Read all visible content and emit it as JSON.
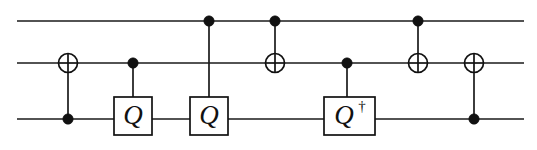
{
  "figure": {
    "type": "quantum-circuit",
    "width": 537,
    "height": 150,
    "background_color": "#ffffff",
    "ink_color": "#111111"
  },
  "wires": [
    {
      "id": "wire-top",
      "index": 0,
      "label": "",
      "y": 21,
      "x_start": 17,
      "x_end": 524
    },
    {
      "id": "wire-middle",
      "index": 1,
      "label": "",
      "y": 63,
      "x_start": 17,
      "x_end": 524
    },
    {
      "id": "wire-bottom",
      "index": 2,
      "label": "",
      "y": 119,
      "x_start": 17,
      "x_end": 524
    }
  ],
  "gates": [
    {
      "id": "gate-1",
      "kind": "cnot",
      "symbol": "⊕",
      "x": 68,
      "control_wire": 2,
      "target_wire": 1,
      "control_y": 119,
      "target_y": 63,
      "label": ""
    },
    {
      "id": "gate-2",
      "kind": "controlled-box",
      "symbol": "Q",
      "x": 133,
      "control_wire": 1,
      "target_wire": 2,
      "control_y": 63,
      "target_y": 119,
      "box": {
        "x": 114,
        "y": 97,
        "width": 38,
        "height": 38
      },
      "label": "Q",
      "dagger": false
    },
    {
      "id": "gate-3",
      "kind": "controlled-box",
      "symbol": "Q",
      "x": 209,
      "control_wire": 0,
      "target_wire": 2,
      "control_y": 21,
      "target_y": 119,
      "box": {
        "x": 190,
        "y": 97,
        "width": 38,
        "height": 38
      },
      "label": "Q",
      "dagger": false
    },
    {
      "id": "gate-4",
      "kind": "cnot",
      "symbol": "⊕",
      "x": 275,
      "control_wire": 0,
      "target_wire": 1,
      "control_y": 21,
      "target_y": 63,
      "label": ""
    },
    {
      "id": "gate-5",
      "kind": "controlled-box",
      "symbol": "Q†",
      "x": 347,
      "control_wire": 1,
      "target_wire": 2,
      "control_y": 63,
      "target_y": 119,
      "box": {
        "x": 324,
        "y": 97,
        "width": 51,
        "height": 38
      },
      "label": "Q",
      "dagger": true,
      "dagger_symbol": "†"
    },
    {
      "id": "gate-6",
      "kind": "cnot",
      "symbol": "⊕",
      "x": 418,
      "control_wire": 0,
      "target_wire": 1,
      "control_y": 21,
      "target_y": 63,
      "label": ""
    },
    {
      "id": "gate-7",
      "kind": "cnot",
      "symbol": "⊕",
      "x": 474,
      "control_wire": 2,
      "target_wire": 1,
      "control_y": 119,
      "target_y": 63,
      "label": ""
    }
  ],
  "geometry": {
    "control_dot_radius": 5.2,
    "target_circle_radius": 9.5
  }
}
